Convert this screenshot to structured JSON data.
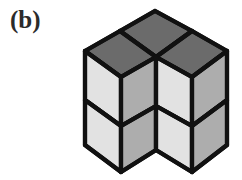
{
  "figure": {
    "panel_label": "(b)",
    "caption": "",
    "type": "isometric-cube-diagram",
    "background_color": "#ffffff",
    "outline_color": "#111111",
    "colors": {
      "top_face": "#6b6b6b",
      "left_face": "#e2e2e2",
      "right_face": "#adadad",
      "outline": "#111111",
      "label_text": "#2b2b2b"
    },
    "structure": {
      "cube_columns": 3,
      "cubes_per_column": 2,
      "total_cubes": 6,
      "arrangement": "three vertical 2-cube columns: front-left, back-center, front-right"
    },
    "geometry": {
      "apex": [
        155,
        11
      ],
      "left_top": [
        85,
        51
      ],
      "right_top": [
        227,
        51
      ],
      "center_junction": [
        156,
        57
      ],
      "bottom_left": [
        85,
        145
      ],
      "bottom_notch": [
        157,
        150
      ],
      "bottom_right": [
        227,
        145
      ],
      "mid_divider_y_left": 96,
      "mid_divider_y_center": 102,
      "mid_divider_y_right": 96
    },
    "faces": {
      "top_left_rhombus": {
        "shade": "top_face",
        "points": "85,51 120,31 156,57 121,77"
      },
      "top_right_rhombus": {
        "shade": "top_face",
        "points": "156,57 192,31 227,51 192,77"
      },
      "top_back_rhombus": {
        "shade": "top_face",
        "points": "120,31 155,11 192,31 156,57"
      },
      "left_upper": {
        "shade": "left_face",
        "points": "85,51 121,77 121,126 85,100"
      },
      "left_lower": {
        "shade": "left_face",
        "points": "85,100 121,126 121,172 85,145"
      },
      "center_left_upper": {
        "shade": "right_face",
        "points": "121,77 156,57 156,106 121,126"
      },
      "center_left_lower": {
        "shade": "right_face",
        "points": "121,126 156,106 156,150 121,172"
      },
      "center_right_upper": {
        "shade": "left_face",
        "points": "156,57 192,77 192,126 156,106"
      },
      "center_right_lower": {
        "shade": "left_face",
        "points": "156,106 192,126 192,172 156,150"
      },
      "right_upper": {
        "shade": "right_face",
        "points": "192,77 227,51 227,100 192,126"
      },
      "right_lower": {
        "shade": "right_face",
        "points": "192,126 227,100 227,145 192,172"
      }
    }
  }
}
